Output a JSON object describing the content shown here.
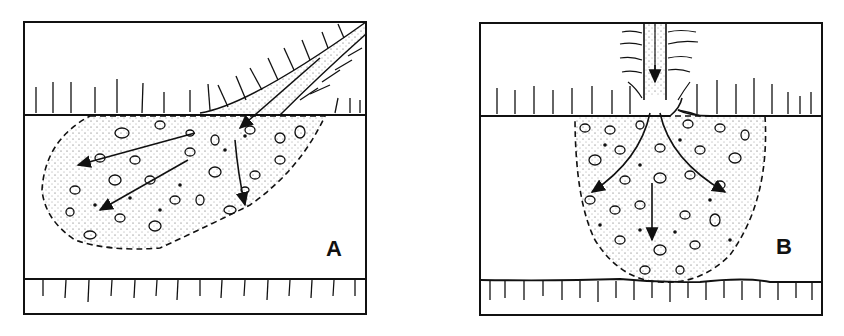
{
  "figure": {
    "panels": [
      {
        "id": "A",
        "label": "A",
        "description": "Oblique inflow deposit spreading laterally along the layer boundary"
      },
      {
        "id": "B",
        "label": "B",
        "description": "Vertical inflow deposit spreading radially downward into a bowl shape"
      }
    ],
    "colors": {
      "ink": "#111111",
      "background": "#ffffff"
    }
  }
}
